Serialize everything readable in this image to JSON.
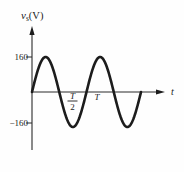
{
  "chart_data": {
    "type": "line",
    "title": "",
    "xlabel": "t",
    "ylabel": "vs(V)",
    "ylabel_parts": {
      "var": "v",
      "sub": "s",
      "unit": "(V)"
    },
    "y_ticks": [
      160,
      -160
    ],
    "y_tick_labels": [
      "160",
      "−160"
    ],
    "x_tick_half": {
      "num": "T",
      "den": "2"
    },
    "x_tick_full": "T",
    "series": [
      {
        "name": "vs",
        "waveform": "sine",
        "amplitude": 160,
        "phase_deg": 0,
        "periods_shown": 2,
        "x": [
          "0",
          "T/4",
          "T/2",
          "3T/4",
          "T",
          "5T/4",
          "3T/2",
          "7T/4",
          "2T"
        ],
        "values": [
          0,
          160,
          0,
          -160,
          0,
          160,
          0,
          -160,
          0
        ]
      }
    ],
    "ylim": [
      -200,
      200
    ],
    "xlim_periods": [
      0,
      2
    ],
    "grid": false,
    "legend": false,
    "line_color": "#1c1c1c"
  }
}
